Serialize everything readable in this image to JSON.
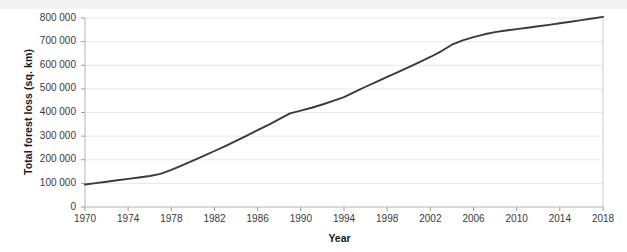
{
  "chart_data": {
    "type": "line",
    "title": "",
    "xlabel": "Year",
    "ylabel": "Total forest loss (sq. km)",
    "xlim": [
      1970,
      2018
    ],
    "ylim": [
      0,
      800000
    ],
    "grid": "horizontal",
    "legend": "none",
    "line_color": "#3a3a3a",
    "xticks": [
      "1970",
      "1974",
      "1978",
      "1982",
      "1986",
      "1990",
      "1994",
      "1998",
      "2002",
      "2006",
      "2010",
      "2014",
      "2018"
    ],
    "xtick_values": [
      1970,
      1974,
      1978,
      1982,
      1986,
      1990,
      1994,
      1998,
      2002,
      2006,
      2010,
      2014,
      2018
    ],
    "yticks": [
      "0",
      "100 000",
      "200 000",
      "300 000",
      "400 000",
      "500 000",
      "600 000",
      "700 000",
      "800 000"
    ],
    "ytick_values": [
      0,
      100000,
      200000,
      300000,
      400000,
      500000,
      600000,
      700000,
      800000
    ],
    "series": [
      {
        "name": "Total forest loss",
        "x": [
          1970,
          1971,
          1972,
          1973,
          1974,
          1975,
          1976,
          1977,
          1978,
          1979,
          1980,
          1981,
          1982,
          1983,
          1984,
          1985,
          1986,
          1987,
          1988,
          1989,
          1990,
          1991,
          1992,
          1993,
          1994,
          1995,
          1996,
          1997,
          1998,
          1999,
          2000,
          2001,
          2002,
          2003,
          2004,
          2005,
          2006,
          2007,
          2008,
          2009,
          2010,
          2011,
          2012,
          2013,
          2014,
          2015,
          2016,
          2017,
          2018
        ],
        "values": [
          95000,
          101000,
          107000,
          113000,
          119000,
          125000,
          131000,
          140000,
          157000,
          176000,
          196000,
          216000,
          237000,
          258000,
          280000,
          302000,
          325000,
          348000,
          372000,
          396000,
          408000,
          420000,
          434000,
          449000,
          465000,
          487000,
          509000,
          530000,
          551000,
          571000,
          592000,
          613000,
          635000,
          659000,
          687000,
          705000,
          719000,
          731000,
          740000,
          747000,
          753000,
          759000,
          765000,
          771000,
          778000,
          784000,
          791000,
          798000,
          805000
        ]
      }
    ]
  },
  "axes": {
    "plot_left_px": 85,
    "plot_right_px": 603,
    "plot_top_px": 18,
    "plot_bottom_px": 207
  }
}
